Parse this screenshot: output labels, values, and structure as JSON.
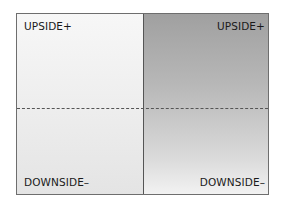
{
  "diagram": {
    "type": "two-column quadrant",
    "quadrants": {
      "top_left": "UPSIDE+",
      "top_right": "UPSIDE+",
      "bottom_left": "DOWNSIDE–",
      "bottom_right": "DOWNSIDE–"
    },
    "colors": {
      "border": "#6e6e6e",
      "left_fill": "#efefef",
      "right_fill_top": "#a0a0a0",
      "right_fill_bottom": "#f2f2f2",
      "divider": "#555555"
    }
  }
}
